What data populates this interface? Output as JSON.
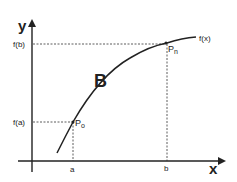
{
  "diagram": {
    "axes": {
      "x_label": "x",
      "y_label": "y"
    },
    "curve": {
      "name_label": "B",
      "function_label": "f(x)"
    },
    "points": {
      "start": {
        "label": "P",
        "subscript": "o"
      },
      "end": {
        "label": "P",
        "subscript": "n"
      }
    },
    "ticks": {
      "x": [
        {
          "label": "a"
        },
        {
          "label": "b"
        }
      ],
      "y": [
        {
          "label": "f(a)"
        },
        {
          "label": "f(b)"
        }
      ]
    },
    "colors": {
      "ink": "#222222",
      "background": "#ffffff"
    }
  }
}
